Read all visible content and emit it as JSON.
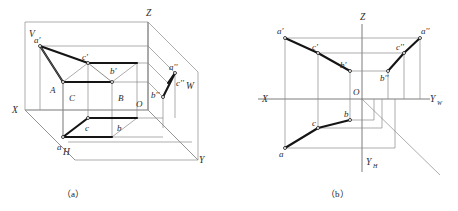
{
  "figure": {
    "caption_a": "（a）",
    "caption_b": "（b）"
  },
  "panel_a": {
    "name": "three-projection-plane-pictorial",
    "planes": {
      "v_label": "V",
      "h_label": "H",
      "w_label": "W"
    },
    "axes": {
      "x": "X",
      "y": "Y",
      "z": "Z"
    },
    "origin": "O",
    "space_points": {
      "A": "A",
      "B": "B",
      "C": "C"
    },
    "v_projections": {
      "a_prime": "a'",
      "b_prime": "b'",
      "c_prime": "c'"
    },
    "h_projections": {
      "a": "a",
      "b": "b",
      "c": "c"
    },
    "w_projections": {
      "a_dprime": "a''",
      "b_dprime": "b''",
      "c_dprime": "c''"
    }
  },
  "panel_b": {
    "name": "unfolded-projection-drawing",
    "axes": {
      "x": "X",
      "z": "Z",
      "yw": "Y",
      "yw_sub": "W",
      "yh": "Y",
      "yh_sub": "H"
    },
    "origin": "O",
    "v_projections": {
      "a_prime": "a'",
      "b_prime": "b'",
      "c_prime": "c'"
    },
    "h_projections": {
      "a": "a",
      "b": "b",
      "c": "c"
    },
    "w_projections": {
      "a_dprime": "a''",
      "b_dprime": "b''",
      "c_dprime": "c''"
    }
  },
  "colors": {
    "stroke_bold": "#151515",
    "stroke_thin": "#8a8a8a",
    "background": "#ffffff"
  }
}
